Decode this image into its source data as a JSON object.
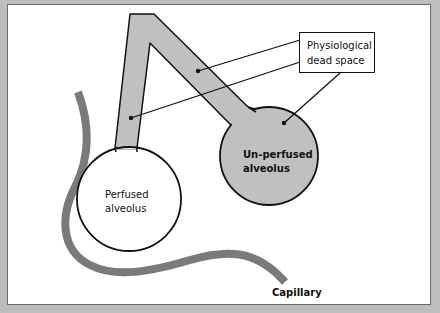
{
  "diagram": {
    "title": "Physiological dead space",
    "labels": {
      "callout": [
        "Physiological",
        "dead space"
      ],
      "perfused": [
        "Perfused",
        "alveolus"
      ],
      "unperfused": [
        "Un-perfused",
        "alveolus"
      ],
      "capillary": "Capillary"
    },
    "colors": {
      "airway_fill": "#c0c0c0",
      "unperfused_fill": "#c0c0c0",
      "perfused_fill": "#ffffff",
      "capillary_stroke": "#7a7a7a",
      "outline": "#111111",
      "frame": "#bdbdbd"
    },
    "nodes": [
      {
        "id": "airway",
        "shape": "inverted-V tube"
      },
      {
        "id": "perfused-alveolus",
        "shape": "circle",
        "fill": "white"
      },
      {
        "id": "unperfused-alveolus",
        "shape": "circle",
        "fill": "grey"
      },
      {
        "id": "capillary",
        "shape": "curved thick line"
      },
      {
        "id": "callout-box",
        "text": "Physiological dead space"
      }
    ],
    "edges": [
      {
        "from": "callout-box",
        "to": "airway-right-branch"
      },
      {
        "from": "callout-box",
        "to": "airway-left-branch"
      },
      {
        "from": "callout-box",
        "to": "unperfused-alveolus"
      }
    ]
  }
}
